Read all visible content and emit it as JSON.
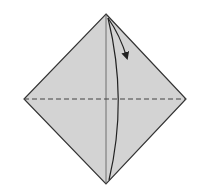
{
  "diagram": {
    "type": "origami-fold-step",
    "paper_color": "#d3d3d3",
    "line_color": "#333333",
    "square": {
      "top": [
        106,
        14
      ],
      "right": [
        186,
        99
      ],
      "bottom": [
        106,
        184
      ],
      "left": [
        24,
        99
      ]
    },
    "crease_vertical": {
      "from": [
        106,
        14
      ],
      "to": [
        106,
        184
      ],
      "style": "solid"
    },
    "valley_fold_line": {
      "from": [
        24,
        99
      ],
      "to": [
        186,
        99
      ],
      "style": "dashed"
    },
    "fold_arrow": {
      "direction": "top-to-bottom",
      "label": ""
    }
  }
}
